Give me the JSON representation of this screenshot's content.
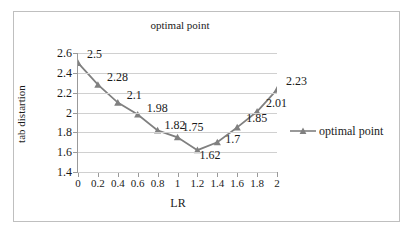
{
  "chart_data": {
    "type": "line",
    "title": "optimal point",
    "xlabel": "LR",
    "ylabel": "tab distartion",
    "xlim": [
      0,
      2
    ],
    "ylim": [
      1.4,
      2.6
    ],
    "grid": true,
    "legend_position": "right",
    "categories": [
      "0",
      "0.2",
      "0.4",
      "0.6",
      "0.8",
      "1",
      "1.2",
      "1.4",
      "1.6",
      "1.8",
      "2"
    ],
    "x": [
      0,
      0.2,
      0.4,
      0.6,
      0.8,
      1,
      1.2,
      1.4,
      1.6,
      1.8,
      2
    ],
    "series": [
      {
        "name": "optimal point",
        "values": [
          2.5,
          2.28,
          2.1,
          1.98,
          1.82,
          1.75,
          1.62,
          1.7,
          1.85,
          2.01,
          2.23
        ],
        "color": "#808080",
        "marker": "triangle"
      }
    ],
    "data_labels": [
      "2.5",
      "2.28",
      "2.1",
      "1.98",
      "1.82",
      "1.75",
      "1.62",
      "1.7",
      "1.85",
      "2.01",
      "2.23"
    ],
    "ytick_labels": [
      "2.6",
      "2.4",
      "2.2",
      "2",
      "1.8",
      "1.6",
      "1.4"
    ],
    "yticks": [
      2.6,
      2.4,
      2.2,
      2.0,
      1.8,
      1.6,
      1.4
    ],
    "xtick_labels": [
      "0",
      "0.2",
      "0.4",
      "0.6",
      "0.8",
      "1",
      "1.2",
      "1.4",
      "1.6",
      "1.8",
      "2"
    ]
  },
  "legend": {
    "entries": [
      {
        "label": "optimal point"
      }
    ]
  },
  "colors": {
    "series": "#808080",
    "gridline": "#d0d0d0",
    "axis": "#9a9a9a",
    "border": "#bfbfbf",
    "text": "#1a1a1a",
    "background": "#ffffff"
  }
}
